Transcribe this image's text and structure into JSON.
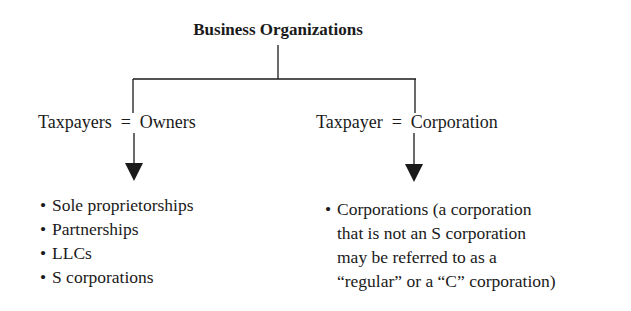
{
  "diagram": {
    "title": "Business Organizations",
    "branches": [
      {
        "label_left": "Taxpayers",
        "equals": "=",
        "label_right": "Owners",
        "items": [
          "Sole proprietorships",
          "Partnerships",
          "LLCs",
          "S corporations"
        ]
      },
      {
        "label_left": "Taxpayer",
        "equals": "=",
        "label_right": "Corporation",
        "items": [
          "Corporations (a corporation that is not an S corporation may be referred to as a “regular” or a “C” corporation)"
        ],
        "item_lines": [
          "Corporations (a corporation",
          "that is not an S corporation",
          "may be referred to as a",
          "“regular” or a “C” corporation)"
        ]
      }
    ],
    "bullet": "•",
    "colors": {
      "line": "#1a1a1a",
      "text": "#1a1a1a",
      "background": "#ffffff"
    }
  }
}
